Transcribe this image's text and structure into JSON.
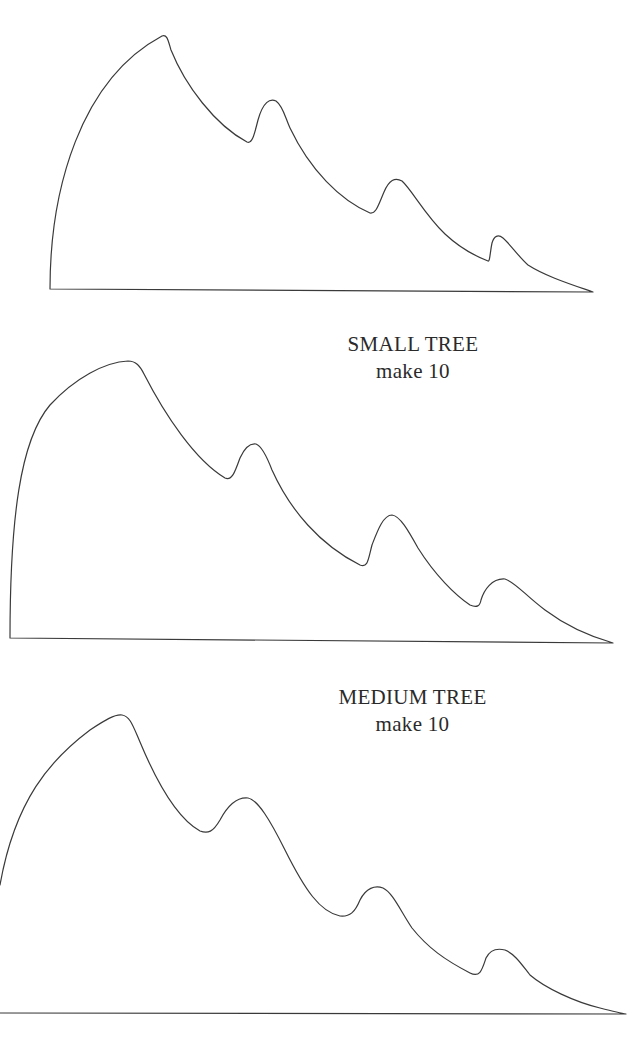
{
  "shapes": [
    {
      "name": "large-tree",
      "label": null
    },
    {
      "name": "small-tree",
      "label": "SMALL TREE",
      "quantity": "make 10"
    },
    {
      "name": "medium-tree",
      "label": "MEDIUM TREE",
      "quantity": "make 10"
    }
  ],
  "labels": {
    "small": {
      "title": "SMALL TREE",
      "quantity": "make 10"
    },
    "medium": {
      "title": "MEDIUM TREE",
      "quantity": "make 10"
    }
  },
  "colors": {
    "outline": "#3a3a3a",
    "text": "#2a2a2a",
    "background": "#ffffff"
  }
}
